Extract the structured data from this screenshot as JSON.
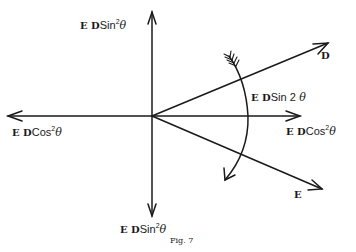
{
  "figure": {
    "caption": "Fig. 7",
    "labels": {
      "top": {
        "ed": "E D",
        "fn": "Sin",
        "exp": "2",
        "var": "θ"
      },
      "left": {
        "ed": "E D",
        "fn": "Cos",
        "exp": "2",
        "var": "θ"
      },
      "right": {
        "ed": "E D",
        "fn": "Cos",
        "exp": "2",
        "var": "θ"
      },
      "bottom": {
        "ed": "E D",
        "fn": "Sin",
        "exp": "2",
        "var": "θ"
      },
      "arc": {
        "ed": "E D",
        "fn": "Sin 2",
        "var": "θ"
      },
      "vector_d": "D",
      "vector_e": "E"
    },
    "colors": {
      "ink": "#1a1a1a",
      "background": "#ffffff"
    }
  }
}
